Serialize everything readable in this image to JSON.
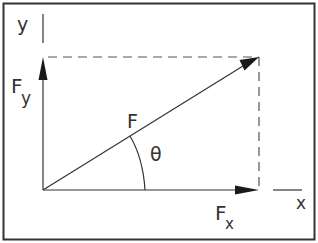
{
  "diagram": {
    "labels": {
      "y_axis": "y",
      "x_axis": "x",
      "force": "F",
      "force_y_main": "F",
      "force_y_sub": "y",
      "force_x_main": "F",
      "force_x_sub": "x",
      "angle": "θ"
    },
    "colors": {
      "stroke": "#333333",
      "dashed": "#555555",
      "frame": "#333333",
      "background": "#ffffff"
    }
  }
}
